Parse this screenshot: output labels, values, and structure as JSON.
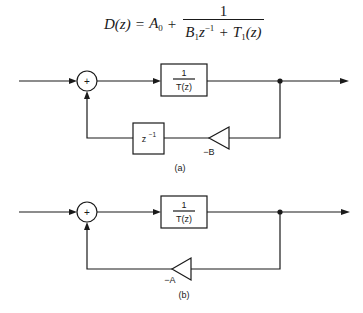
{
  "equation": {
    "lhs": "D(z)",
    "equals": "=",
    "term": "A",
    "term_sub": "0",
    "plus": "+",
    "numerator": "1",
    "den_B": "B",
    "den_B_sub": "1",
    "den_z": "z",
    "den_z_sup": "−1",
    "den_plus": "+",
    "den_T": "T",
    "den_T_sub": "1",
    "den_T_arg": "(z)"
  },
  "diagram_a": {
    "sum_symbol": "+",
    "block_numerator": "1",
    "block_denominator": "T(z)",
    "delay_label": "z",
    "delay_sup": "−1",
    "gain_label": "−B",
    "caption": "(a)"
  },
  "diagram_b": {
    "sum_symbol": "+",
    "block_numerator": "1",
    "block_denominator": "T(z)",
    "gain_label": "−A",
    "caption": "(b)"
  },
  "colors": {
    "line": "#1a1a1a",
    "background": "#ffffff"
  }
}
